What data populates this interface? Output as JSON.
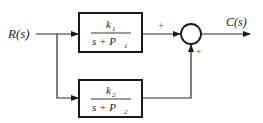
{
  "diagram": {
    "type": "block-diagram",
    "input": {
      "label": "R(s)"
    },
    "output": {
      "label": "C(s)"
    },
    "blocks": [
      {
        "id": "G1",
        "numerator": "k",
        "num_sub": "1",
        "denominator": "s + P",
        "den_sub": "1"
      },
      {
        "id": "G2",
        "numerator": "k",
        "num_sub": "2",
        "denominator": "s + P",
        "den_sub": "2"
      }
    ],
    "summing_junction": {
      "inputs": [
        {
          "from": "G1",
          "sign": "+"
        },
        {
          "from": "G2",
          "sign": "+"
        }
      ]
    },
    "colors": {
      "line": "#2a2a2a",
      "text": "#222222",
      "background": "#ffffff"
    }
  }
}
